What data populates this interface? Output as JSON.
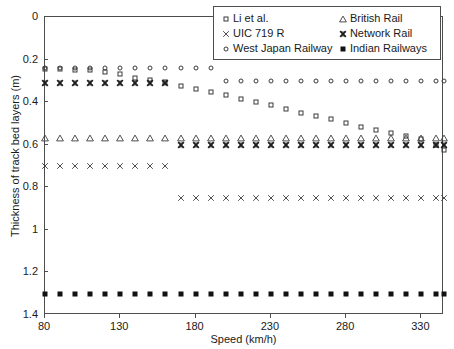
{
  "chart_data": {
    "type": "scatter",
    "title": "",
    "xlabel": "Speed (km/h)",
    "ylabel": "Thickness of track bed layers (m)",
    "xlim": [
      80,
      345
    ],
    "ylim": [
      0,
      1.4
    ],
    "y_inverted": true,
    "grid": false,
    "legend_position": "top-right",
    "xticks": [
      80,
      130,
      180,
      230,
      280,
      330
    ],
    "xtick_labels": [
      "80",
      "130",
      "180",
      "230",
      "280",
      "330"
    ],
    "yticks": [
      0,
      0.2,
      0.4,
      0.6,
      0.8,
      1,
      1.2,
      1.4
    ],
    "ytick_labels": [
      "0",
      "0.2",
      "0.4",
      "0.6",
      "0.8",
      "1",
      "1.2",
      "1.4"
    ],
    "x": [
      80,
      90,
      100,
      110,
      120,
      130,
      140,
      150,
      160,
      170,
      180,
      190,
      200,
      210,
      220,
      230,
      240,
      250,
      260,
      270,
      280,
      290,
      300,
      310,
      320,
      330,
      340,
      345
    ],
    "series": [
      {
        "name": "Li et al.",
        "marker": "square",
        "values": [
          0.245,
          0.245,
          0.25,
          0.25,
          0.26,
          0.27,
          0.285,
          0.295,
          0.305,
          0.325,
          0.34,
          0.35,
          0.365,
          0.385,
          0.4,
          0.415,
          0.43,
          0.45,
          0.465,
          0.48,
          0.5,
          0.515,
          0.53,
          0.545,
          0.56,
          0.575,
          0.6,
          0.625
        ]
      },
      {
        "name": "UIC 719 R",
        "marker": "x",
        "values": [
          0.7,
          0.7,
          0.7,
          0.7,
          0.7,
          0.7,
          0.7,
          0.7,
          0.7,
          0.85,
          0.85,
          0.85,
          0.85,
          0.85,
          0.85,
          0.85,
          0.85,
          0.85,
          0.85,
          0.85,
          0.85,
          0.85,
          0.85,
          0.85,
          0.85,
          0.85,
          0.85,
          0.85
        ]
      },
      {
        "name": "West Japan Railway",
        "marker": "circle",
        "values": [
          0.24,
          0.24,
          0.24,
          0.24,
          0.24,
          0.24,
          0.24,
          0.24,
          0.24,
          0.24,
          0.24,
          0.24,
          0.3,
          0.3,
          0.3,
          0.3,
          0.3,
          0.3,
          0.3,
          0.3,
          0.3,
          0.3,
          0.3,
          0.3,
          0.3,
          0.3,
          0.3,
          0.3
        ]
      },
      {
        "name": "British Rail",
        "marker": "triangle",
        "values": [
          0.57,
          0.57,
          0.57,
          0.57,
          0.57,
          0.57,
          0.57,
          0.57,
          0.57,
          0.57,
          0.57,
          0.57,
          0.57,
          0.57,
          0.57,
          0.57,
          0.57,
          0.57,
          0.57,
          0.57,
          0.57,
          0.57,
          0.57,
          0.57,
          0.57,
          0.57,
          0.57,
          0.57
        ]
      },
      {
        "name": "Network Rail",
        "marker": "x-bold",
        "values": [
          0.31,
          0.31,
          0.31,
          0.31,
          0.31,
          0.31,
          0.31,
          0.31,
          0.31,
          0.6,
          0.6,
          0.6,
          0.6,
          0.6,
          0.6,
          0.6,
          0.6,
          0.6,
          0.6,
          0.6,
          0.6,
          0.6,
          0.6,
          0.6,
          0.6,
          0.6,
          0.6,
          0.6
        ]
      },
      {
        "name": "Indian Railways",
        "marker": "filled-square",
        "values": [
          1.3,
          1.3,
          1.3,
          1.3,
          1.3,
          1.3,
          1.3,
          1.3,
          1.3,
          1.3,
          1.3,
          1.3,
          1.3,
          1.3,
          1.3,
          1.3,
          1.3,
          1.3,
          1.3,
          1.3,
          1.3,
          1.3,
          1.3,
          1.3,
          1.3,
          1.3,
          1.3,
          1.3
        ]
      }
    ]
  },
  "legend": {
    "entries": [
      {
        "label": "Li et al.",
        "marker": "square"
      },
      {
        "label": "British Rail",
        "marker": "triangle"
      },
      {
        "label": "UIC 719 R",
        "marker": "x"
      },
      {
        "label": "Network Rail",
        "marker": "x-bold"
      },
      {
        "label": "West Japan Railway",
        "marker": "circle"
      },
      {
        "label": "Indian Railways",
        "marker": "filled-square"
      }
    ]
  },
  "colors": {
    "axis": "#4d4d4d",
    "marker_outline": "#3a3a3a",
    "marker_fill": "#111111",
    "background": "#ffffff",
    "text": "#1a1a1a"
  },
  "glyphs": {
    "x": "×",
    "x-bold": "×"
  }
}
